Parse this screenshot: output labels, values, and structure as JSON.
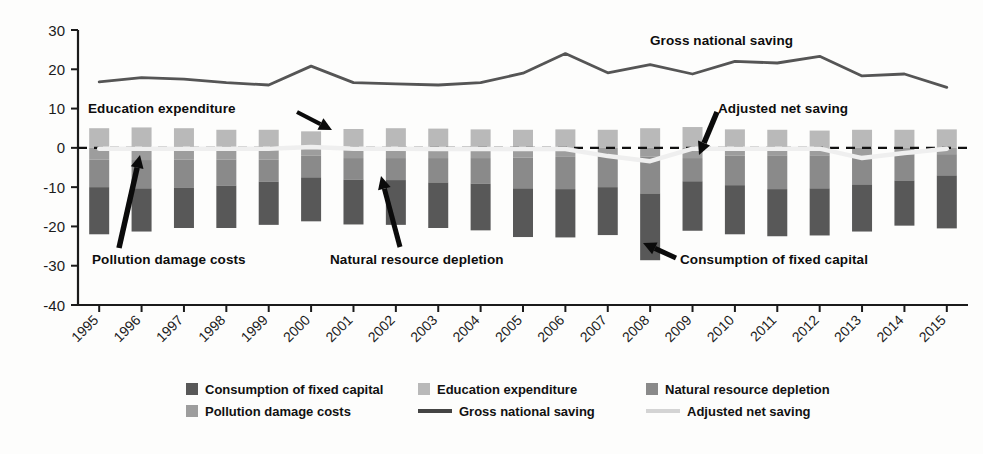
{
  "chart_data": {
    "type": "bar",
    "subtype": "stacked-bar-with-lines",
    "title": "",
    "xlabel": "",
    "ylabel": "",
    "ylim": [
      -40,
      30
    ],
    "yticks": [
      30,
      20,
      10,
      0,
      -10,
      -20,
      -30,
      -40
    ],
    "ytick_labels": [
      "30",
      "20",
      "10",
      "0",
      "-10",
      "-20",
      "-30",
      "-40"
    ],
    "grid": false,
    "zero_line": "dashed",
    "legend_position": "bottom",
    "categories": [
      "1995",
      "1996",
      "1997",
      "1998",
      "1999",
      "2000",
      "2001",
      "2002",
      "2003",
      "2004",
      "2005",
      "2006",
      "2007",
      "2008",
      "2009",
      "2010",
      "2011",
      "2012",
      "2013",
      "2014",
      "2015"
    ],
    "series": [
      {
        "name": "Education expenditure",
        "kind": "bar",
        "stack": "positive",
        "color": "#b9b9b9",
        "values": [
          5.0,
          5.2,
          5.0,
          4.6,
          4.6,
          4.2,
          4.8,
          5.0,
          4.9,
          4.7,
          4.6,
          4.7,
          4.6,
          5.0,
          5.3,
          4.7,
          4.6,
          4.4,
          4.6,
          4.6,
          4.7
        ]
      },
      {
        "name": "Pollution damage costs",
        "kind": "bar",
        "stack": "negative",
        "color": "#9d9d9d",
        "values": [
          -3.0,
          -3.1,
          -3.0,
          -3.0,
          -3.0,
          -2.0,
          -2.6,
          -2.6,
          -2.6,
          -2.6,
          -2.5,
          -2.3,
          -2.2,
          -2.2,
          -2.6,
          -2.0,
          -1.9,
          -1.9,
          -1.9,
          -1.7,
          -1.6
        ]
      },
      {
        "name": "Natural resource depletion",
        "kind": "bar",
        "stack": "negative",
        "color": "#8a8a8a",
        "values": [
          -7.0,
          -7.2,
          -7.2,
          -6.6,
          -5.6,
          -5.5,
          -5.5,
          -5.6,
          -6.2,
          -6.5,
          -7.8,
          -8.2,
          -7.8,
          -9.4,
          -5.9,
          -7.5,
          -8.6,
          -8.4,
          -7.4,
          -6.6,
          -5.4
        ]
      },
      {
        "name": "Consumption of fixed capital",
        "kind": "bar",
        "stack": "negative",
        "color": "#585858",
        "values": [
          -12.0,
          -11.0,
          -10.2,
          -10.8,
          -11.0,
          -11.2,
          -11.4,
          -11.4,
          -11.6,
          -11.9,
          -12.4,
          -12.3,
          -12.2,
          -17.0,
          -12.6,
          -12.5,
          -12.0,
          -12.0,
          -12.0,
          -11.5,
          -13.5
        ]
      },
      {
        "name": "Gross national saving",
        "kind": "line",
        "color": "#555555",
        "values": [
          16.8,
          17.9,
          17.5,
          16.6,
          16.0,
          20.8,
          16.6,
          16.3,
          16.0,
          16.6,
          19.0,
          24.0,
          19.1,
          21.2,
          18.8,
          22.0,
          21.6,
          23.3,
          18.3,
          18.8,
          15.4
        ]
      },
      {
        "name": "Adjusted net saving",
        "kind": "line",
        "color": "#efefef",
        "values": [
          -0.2,
          -0.2,
          -0.2,
          -0.2,
          -0.2,
          0.2,
          -0.2,
          -0.2,
          -0.3,
          -0.3,
          -0.3,
          -0.3,
          -2.1,
          -3.4,
          -0.2,
          -0.2,
          -0.2,
          -0.2,
          -2.6,
          -1.3,
          -0.2
        ]
      }
    ],
    "annotations": [
      {
        "name": "education-expenditure",
        "text": "Education expenditure"
      },
      {
        "name": "pollution-damage-costs",
        "text": "Pollution damage costs"
      },
      {
        "name": "natural-resource-depletion",
        "text": "Natural resource depletion"
      },
      {
        "name": "adjusted-net-saving",
        "text": "Adjusted net saving"
      },
      {
        "name": "gross-national-saving",
        "text": "Gross national saving"
      },
      {
        "name": "consumption-of-fixed-capital",
        "text": "Consumption of fixed capital"
      }
    ]
  },
  "axis": {
    "y_labels": [
      "30",
      "20",
      "10",
      "0",
      "-10",
      "-20",
      "-30",
      "-40"
    ],
    "x_labels": [
      "1995",
      "1996",
      "1997",
      "1998",
      "1999",
      "2000",
      "2001",
      "2002",
      "2003",
      "2004",
      "2005",
      "2006",
      "2007",
      "2008",
      "2009",
      "2010",
      "2011",
      "2012",
      "2013",
      "2014",
      "2015"
    ]
  },
  "annotations": {
    "education": "Education expenditure",
    "pollution": "Pollution damage costs",
    "natural": "Natural resource depletion",
    "adjusted": "Adjusted net saving",
    "gross": "Gross national saving",
    "cfc": "Consumption of fixed capital"
  },
  "legend": {
    "items": [
      {
        "label": "Consumption of fixed capital",
        "type": "swatch",
        "color": "#585858"
      },
      {
        "label": "Education expenditure",
        "type": "swatch",
        "color": "#b9b9b9"
      },
      {
        "label": "Natural resource depletion",
        "type": "swatch",
        "color": "#8a8a8a"
      },
      {
        "label": "Pollution damage costs",
        "type": "swatch",
        "color": "#9d9d9d"
      },
      {
        "label": "Gross national saving",
        "type": "line",
        "color": "#444444",
        "style": "solid"
      },
      {
        "label": "Adjusted net saving",
        "type": "line",
        "color": "#d4d4d4",
        "style": "solid"
      }
    ]
  }
}
